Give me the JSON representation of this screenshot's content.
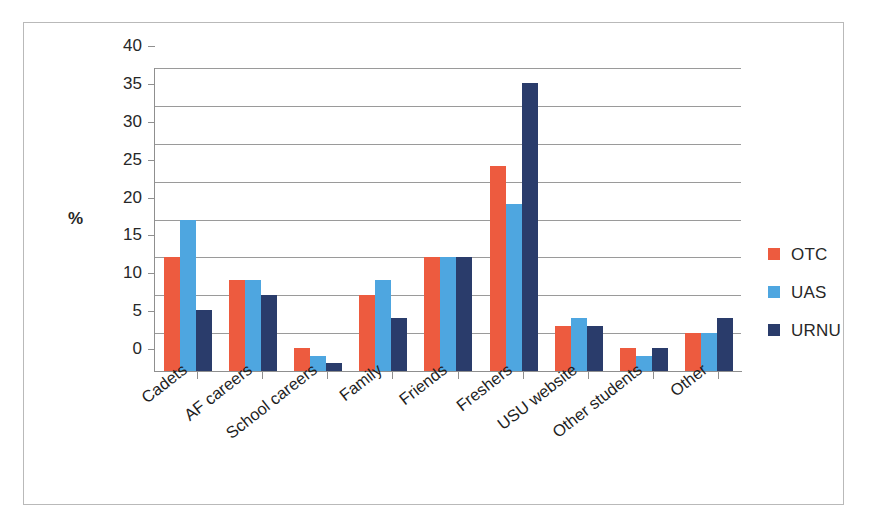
{
  "chart_data": {
    "type": "bar",
    "title": "",
    "xlabel": "",
    "ylabel": "%",
    "ylim": [
      0,
      40
    ],
    "ytick_step": 5,
    "yticks": [
      40,
      35,
      30,
      25,
      20,
      15,
      10,
      5,
      0
    ],
    "grid": true,
    "legend_position": "right",
    "categories": [
      "Cadets",
      "AF careers",
      "School careers",
      "Family",
      "Friends",
      "Freshers",
      "USU website",
      "Other students",
      "Other"
    ],
    "series": [
      {
        "name": "OTC",
        "color": "#ED5B3F",
        "values": [
          15,
          12,
          3,
          10,
          15,
          27,
          6,
          3,
          5
        ]
      },
      {
        "name": "UAS",
        "color": "#4EA6E0",
        "values": [
          20,
          12,
          2,
          12,
          15,
          22,
          7,
          2,
          5
        ]
      },
      {
        "name": "URNU",
        "color": "#2A3C6B",
        "values": [
          8,
          10,
          1,
          7,
          15,
          38,
          6,
          3,
          7
        ]
      }
    ]
  },
  "colors": {
    "otc": "#ED5B3F",
    "uas": "#4EA6E0",
    "urnu": "#2A3C6B",
    "gridline": "#9A9A9A",
    "axis": "#8F8F8F",
    "frame": "#B9B9B9",
    "text": "#272727",
    "background": "#FFFFFF"
  }
}
